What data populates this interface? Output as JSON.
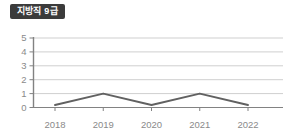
{
  "title_badge": "지방직 9급",
  "colors": {
    "badge_bg": "#3b3b3b",
    "badge_text": "#ffffff",
    "grid": "#cfcfcf",
    "axis": "#828282",
    "line": "#616161",
    "label": "#8a8a8a"
  },
  "chart_data": {
    "type": "line",
    "title": "지방직 9급",
    "categories": [
      "2018",
      "2019",
      "2020",
      "2021",
      "2022"
    ],
    "values": [
      0,
      1,
      0,
      1,
      0
    ],
    "xlabel": "",
    "ylabel": "",
    "ylim": [
      0,
      5
    ],
    "yticks": [
      0,
      1,
      2,
      3,
      4,
      5
    ],
    "grid": "horizontal",
    "legend": "none"
  }
}
